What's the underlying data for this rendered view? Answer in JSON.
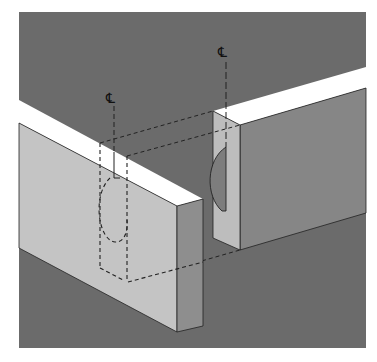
{
  "figure": {
    "background_color": "#6b6b6b",
    "colors": {
      "board_top": "#ffffff",
      "left_board_face": "#c4c4c4",
      "left_board_end": "#8e8e8e",
      "right_board_end": "#bdbdbd",
      "right_board_face": "#868686",
      "slot": "#7d7d7d",
      "line": "#222222"
    },
    "labels": {
      "centerline_left": "℄",
      "centerline_right": "℄"
    },
    "parts": [
      {
        "name": "left-board",
        "description": "Board with hidden biscuit slot (dashed)"
      },
      {
        "name": "right-board",
        "description": "Board with exposed biscuit slot on end grain"
      }
    ]
  }
}
